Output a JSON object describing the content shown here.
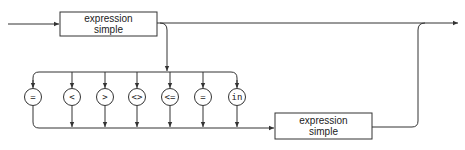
{
  "diagram": {
    "type": "syntax-railroad-diagram",
    "top_box": {
      "line1": "expression",
      "line2": "simple"
    },
    "bottom_box": {
      "line1": "expression",
      "line2": "simple"
    },
    "operators": [
      {
        "symbol": "="
      },
      {
        "symbol": "<"
      },
      {
        "symbol": ">"
      },
      {
        "symbol": "<>"
      },
      {
        "symbol": "<="
      },
      {
        "symbol": "="
      },
      {
        "symbol": "in"
      }
    ],
    "colors": {
      "stroke": "#333333",
      "background": "#ffffff"
    }
  }
}
